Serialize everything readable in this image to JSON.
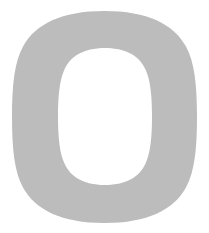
{
  "image": {
    "kind": "letterform-glyph",
    "description": "Large capital letter O rendered as a flat silhouette",
    "width": 209,
    "height": 233,
    "background_color": "#ffffff"
  },
  "glyph": {
    "character": "O",
    "name": "letter-o-glyph",
    "fill_color": "#bcbcbc",
    "stroke_color": "none",
    "outer_bounds": {
      "left": 12,
      "top": 11,
      "right": 197,
      "bottom": 223,
      "width": 185,
      "height": 212
    },
    "counter_bounds": {
      "left": 58,
      "top": 48,
      "right": 152,
      "bottom": 185,
      "width": 94,
      "height": 137
    },
    "center": {
      "x": 104.5,
      "y": 117
    },
    "stroke_weight": {
      "side": 46,
      "top": 37,
      "bottom": 38
    }
  },
  "geometry": {
    "outer_path": "M 104.5 11 C 147.5 11 173.5 24 186.0 46.5 C 194.5 62.0 197.0 85.0 197.0 117.0 C 197.0 149.0 194.5 172.0 186.0 187.5 C 173.5 210.0 147.5 223.0 104.5 223.0 C 61.5 223.0 35.5 210.0 23.0 187.5 C 14.5 172.0 12.0 149.0 12.0 117.0 C 12.0 85.0 14.5 62.0 23.0 46.5 C 35.5 24.0 61.5 11.0 104.5 11.0 Z",
    "counter_path": "M 105.0 48.0 C 127.0 48.0 140.0 56.5 146.0 70.5 C 150.5 81.0 152.0 96.5 152.0 116.5 C 152.0 136.5 150.5 152.0 146.0 162.5 C 140.0 176.5 127.0 185.0 105.0 185.0 C 83.0 185.0 70.0 176.5 64.0 162.5 C 59.5 152.0 58.0 136.5 58.0 116.5 C 58.0 96.5 59.5 81.0 64.0 70.5 C 70.0 56.5 83.0 48.0 105.0 48.0 Z"
  }
}
